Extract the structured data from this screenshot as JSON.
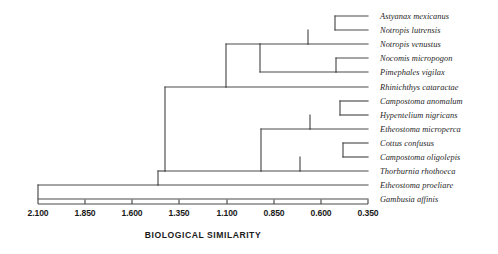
{
  "chart_data": {
    "type": "dendrogram",
    "title": "",
    "xlabel": "BIOLOGICAL SIMILARITY",
    "ylabel": "",
    "axis_orientation": "horizontal-reversed",
    "xlim": [
      2.1,
      0.35
    ],
    "grid": false,
    "legend": null,
    "tick_labels": [
      "2.100",
      "1.850",
      "1.600",
      "1.350",
      "1.100",
      "0.850",
      "0.600",
      "0.350"
    ],
    "tick_values": [
      2.1,
      1.85,
      1.6,
      1.35,
      1.1,
      0.85,
      0.6,
      0.35
    ],
    "leaves": [
      {
        "index": 0,
        "label": "Astyanax  mexicanus"
      },
      {
        "index": 1,
        "label": "Notropis lutrensis"
      },
      {
        "index": 2,
        "label": "Notropis venustus"
      },
      {
        "index": 3,
        "label": "Nocomis micropogon"
      },
      {
        "index": 4,
        "label": "Pimephales vigilax"
      },
      {
        "index": 5,
        "label": "Rhinichthys cataractae"
      },
      {
        "index": 6,
        "label": "Campostoma anomalum"
      },
      {
        "index": 7,
        "label": "Hypentelium nigricans"
      },
      {
        "index": 8,
        "label": "Etheostoma microperca"
      },
      {
        "index": 9,
        "label": "Cottus confusus"
      },
      {
        "index": 10,
        "label": "Campostoma oligolepis"
      },
      {
        "index": 11,
        "label": "Thorburnia rhothoeca"
      },
      {
        "index": 12,
        "label": "Etheostoma proeliare"
      },
      {
        "index": 13,
        "label": "Gambusia affinis"
      }
    ],
    "merges": [
      {
        "id": "m1",
        "members": [
          0,
          1
        ],
        "similarity": 0.525
      },
      {
        "id": "m2",
        "members": [
          0,
          1,
          2
        ],
        "similarity": 0.667
      },
      {
        "id": "m3",
        "members": [
          3,
          4
        ],
        "similarity": 0.52
      },
      {
        "id": "m4",
        "members": [
          0,
          1,
          2,
          3,
          4
        ],
        "similarity": 0.92
      },
      {
        "id": "m5",
        "members": [
          0,
          1,
          2,
          3,
          4,
          5
        ],
        "similarity": 1.1
      },
      {
        "id": "m6",
        "members": [
          6,
          7
        ],
        "similarity": 0.498
      },
      {
        "id": "m7",
        "members": [
          6,
          7,
          8
        ],
        "similarity": 0.658
      },
      {
        "id": "m8",
        "members": [
          9,
          10
        ],
        "similarity": 0.482
      },
      {
        "id": "m9",
        "members": [
          9,
          10,
          11
        ],
        "similarity": 0.71
      },
      {
        "id": "m10",
        "members": [
          6,
          7,
          8,
          9,
          10,
          11
        ],
        "similarity": 1.075
      },
      {
        "id": "m11",
        "members": [
          0,
          1,
          2,
          3,
          4,
          5,
          6,
          7,
          8,
          9,
          10,
          11
        ],
        "similarity": 1.42
      },
      {
        "id": "m12",
        "members": [
          0,
          1,
          2,
          3,
          4,
          5,
          6,
          7,
          8,
          9,
          10,
          11,
          12
        ],
        "similarity": 1.45
      },
      {
        "id": "m13",
        "members": "all",
        "similarity": 2.06
      }
    ],
    "colors": {
      "line": "#4a4a4a",
      "text": "#1a1a1a",
      "label_text": "#262626",
      "background": "#ffffff"
    }
  },
  "layout": {
    "leaf_tip_x": 368,
    "axis_left_x": 38,
    "axis_right_x": 368,
    "axis_y": 204,
    "label_x": 380,
    "row_y": [
      16,
      30,
      44,
      58,
      72,
      87,
      101,
      115,
      129,
      143,
      157,
      171,
      185
    ],
    "node_x": {
      "m1": 335,
      "m2": 308,
      "m3": 336,
      "m4": 260,
      "m5": 226,
      "m6": 340,
      "m7": 310,
      "m8": 343,
      "m9": 300,
      "m10": 261,
      "m11": 165,
      "m12": 158,
      "m13": 38
    },
    "tick_x": [
      38,
      85,
      132,
      179,
      227,
      274,
      321,
      368
    ]
  }
}
